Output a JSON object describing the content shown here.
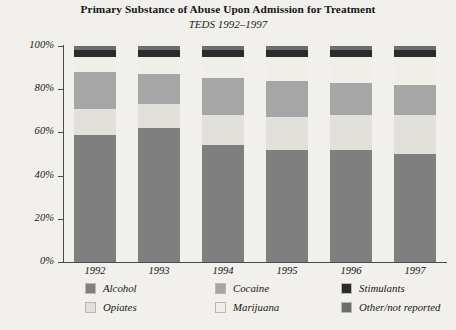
{
  "chart_data": {
    "type": "bar",
    "subtype": "stacked-percentage",
    "title": "Primary Substance of Abuse Upon Admission for Treatment",
    "subtitle": "TEDS 1992–1997",
    "xlabel": "",
    "ylabel": "",
    "ylim": [
      0,
      100
    ],
    "ytick_labels": [
      "100%",
      "80%",
      "60%",
      "40%",
      "20%",
      "0%"
    ],
    "ytick_values": [
      100,
      80,
      60,
      40,
      20,
      0
    ],
    "grid": false,
    "legend_position": "bottom",
    "categories": [
      "1992",
      "1993",
      "1994",
      "1995",
      "1996",
      "1997"
    ],
    "series": [
      {
        "name": "Alcohol",
        "color": "#7f7f7f",
        "values": [
          59,
          62,
          54,
          52,
          52,
          50
        ]
      },
      {
        "name": "Opiates",
        "color": "#e2e0da",
        "values": [
          12,
          11,
          14,
          15,
          16,
          18
        ]
      },
      {
        "name": "Cocaine",
        "color": "#a6a6a6",
        "values": [
          17,
          14,
          17,
          17,
          15,
          14
        ]
      },
      {
        "name": "Marijuana",
        "color": "#efeee9",
        "values": [
          7,
          8,
          10,
          11,
          12,
          13
        ]
      },
      {
        "name": "Stimulants",
        "color": "#2b2b2b",
        "values": [
          3,
          3,
          3,
          3,
          3,
          3
        ]
      },
      {
        "name": "Other/not reported",
        "color": "#6d6d6d",
        "values": [
          2,
          2,
          2,
          2,
          2,
          2
        ]
      }
    ]
  },
  "legend": {
    "items": [
      {
        "label": "Alcohol",
        "color": "#7f7f7f"
      },
      {
        "label": "Cocaine",
        "color": "#a6a6a6"
      },
      {
        "label": "Stimulants",
        "color": "#2b2b2b"
      },
      {
        "label": "Opiates",
        "color": "#e2e0da"
      },
      {
        "label": "Marijuana",
        "color": "#efeee9"
      },
      {
        "label": "Other/not reported",
        "color": "#6d6d6d"
      }
    ]
  },
  "colors": {
    "background": "#f2f0ec",
    "axis": "#4a4a4a",
    "text": "#161616"
  }
}
